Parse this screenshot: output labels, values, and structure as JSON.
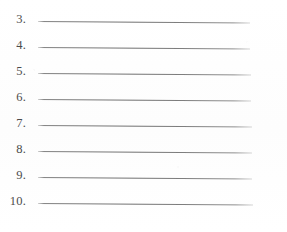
{
  "document": {
    "type": "scanned-worksheet",
    "description": "Blank numbered list with ruled answer lines",
    "background_color": "#fefefe",
    "ink_color": "#3c3c3c",
    "rule_color": "#5e5e5e"
  },
  "list": {
    "start_number": 3,
    "end_number": 10,
    "item_count": 8,
    "items": [
      {
        "number": "3.",
        "answer": "",
        "line_start_x": 38,
        "line_end_x": 250,
        "line_y": 21
      },
      {
        "number": "4.",
        "answer": "",
        "line_start_x": 38,
        "line_end_x": 250,
        "line_y": 47
      },
      {
        "number": "5.",
        "answer": "",
        "line_start_x": 38,
        "line_end_x": 251,
        "line_y": 73
      },
      {
        "number": "6.",
        "answer": "",
        "line_start_x": 38,
        "line_end_x": 251,
        "line_y": 99
      },
      {
        "number": "7.",
        "answer": "",
        "line_start_x": 38,
        "line_end_x": 252,
        "line_y": 125
      },
      {
        "number": "8.",
        "answer": "",
        "line_start_x": 38,
        "line_end_x": 252,
        "line_y": 151
      },
      {
        "number": "9.",
        "answer": "",
        "line_start_x": 38,
        "line_end_x": 252,
        "line_y": 177
      },
      {
        "number": "10.",
        "answer": "",
        "line_start_x": 38,
        "line_end_x": 253,
        "line_y": 203
      }
    ]
  }
}
